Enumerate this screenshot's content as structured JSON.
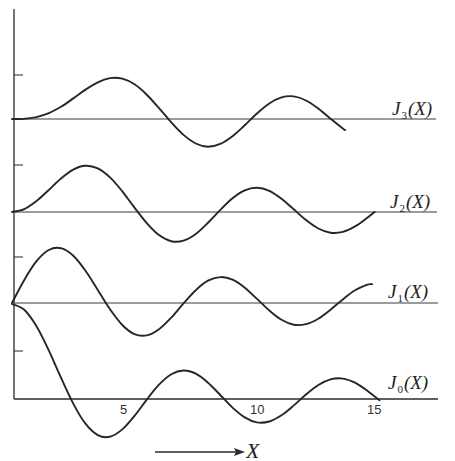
{
  "chart_data": {
    "type": "line",
    "title": "",
    "xlabel": "X",
    "ylabel": "",
    "xlim": [
      0,
      15.5
    ],
    "x_ticks": [
      5,
      10,
      15
    ],
    "x_tick_labels": [
      "5",
      "10",
      "15"
    ],
    "y_ticks_per_series": "tick marks at 0.5 unit spacing on y-axis",
    "grid": false,
    "legend": "inline labels at right end of each baseline",
    "layout": {
      "offset_stacked": true,
      "baseline_offsets_px": {
        "J3": 119,
        "J2": 212,
        "J1": 303,
        "J0": 399
      },
      "px_per_unit_y": 95,
      "px_per_unit_x": 24.5,
      "x_origin_px": 12
    },
    "x": [
      0,
      0.5,
      1,
      1.5,
      2,
      2.5,
      3,
      3.5,
      4,
      4.5,
      5,
      5.5,
      6,
      6.5,
      7,
      7.5,
      8,
      8.5,
      9,
      9.5,
      10,
      10.5,
      11,
      11.5,
      12,
      12.5,
      13,
      13.5,
      14,
      14.5,
      15
    ],
    "series": [
      {
        "name": "J3(X)",
        "label_main": "J",
        "label_sub": "3",
        "label_tail": "(X)",
        "x_end": 13.6,
        "values": [
          0,
          0.0026,
          0.0196,
          0.061,
          0.1289,
          0.2166,
          0.3091,
          0.3868,
          0.4302,
          0.4247,
          0.3648,
          0.2561,
          0.1148,
          -0.0354,
          -0.1676,
          -0.2581,
          -0.2911,
          -0.2626,
          -0.1809,
          -0.0653,
          0.0583,
          0.1633,
          0.2273,
          0.2381,
          0.1951,
          0.11,
          0.0033,
          -0.1,
          -0.18,
          -0.22,
          -0.194
        ]
      },
      {
        "name": "J2(X)",
        "label_main": "J",
        "label_sub": "2",
        "label_tail": "(X)",
        "x_end": 14.8,
        "values": [
          0,
          0.0306,
          0.1149,
          0.2321,
          0.3528,
          0.4461,
          0.4861,
          0.4586,
          0.3641,
          0.2178,
          0.0466,
          -0.1173,
          -0.2429,
          -0.3074,
          -0.3014,
          -0.2303,
          -0.113,
          0.0224,
          0.1448,
          0.2279,
          0.2546,
          0.2216,
          0.139,
          0.028,
          -0.0849,
          -0.1734,
          -0.2177,
          -0.2094,
          -0.152,
          -0.0608,
          0.0416
        ]
      },
      {
        "name": "J1(X)",
        "label_main": "J",
        "label_sub": "1",
        "label_tail": "(X)",
        "x_end": 14.7,
        "values": [
          0,
          0.2423,
          0.4401,
          0.5579,
          0.5767,
          0.4971,
          0.3391,
          0.1374,
          -0.066,
          -0.2311,
          -0.3276,
          -0.3414,
          -0.2767,
          -0.1538,
          -0.0047,
          0.1352,
          0.2346,
          0.2731,
          0.2453,
          0.1613,
          0.0435,
          -0.0789,
          -0.1768,
          -0.2284,
          -0.2234,
          -0.1655,
          -0.0703,
          0.038,
          0.1334,
          0.1934,
          0.2051
        ]
      },
      {
        "name": "J0(X)",
        "label_main": "J",
        "label_sub": "0",
        "label_tail": "(X)",
        "x_end": 15.3,
        "values": [
          1.0,
          0.9385,
          0.7652,
          0.5118,
          0.2239,
          -0.0484,
          -0.2601,
          -0.3801,
          -0.3971,
          -0.3205,
          -0.1776,
          -0.0068,
          0.1506,
          0.2601,
          0.3001,
          0.2663,
          0.1717,
          0.0419,
          -0.0903,
          -0.1939,
          -0.2459,
          -0.2366,
          -0.1712,
          -0.0677,
          0.0477,
          0.1469,
          0.2069,
          0.215,
          0.1711,
          0.0875,
          -0.0142
        ]
      }
    ]
  },
  "labels": {
    "j3": {
      "main": "J",
      "sub": "3",
      "tail": "(X)"
    },
    "j2": {
      "main": "J",
      "sub": "2",
      "tail": "(X)"
    },
    "j1": {
      "main": "J",
      "sub": "1",
      "tail": "(X)"
    },
    "j0": {
      "main": "J",
      "sub": "0",
      "tail": "(X)"
    },
    "x_ticks": [
      "5",
      "10",
      "15"
    ],
    "x_axis": "X"
  }
}
